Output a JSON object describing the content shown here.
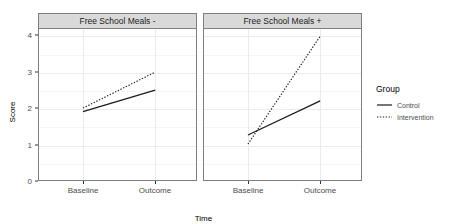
{
  "chart_data": {
    "type": "line",
    "title": "",
    "xlabel": "Time",
    "ylabel": "Score",
    "categories": [
      "Baseline",
      "Outcome"
    ],
    "ylim": [
      0,
      4.2
    ],
    "yticks": [
      0,
      1,
      2,
      3,
      4
    ],
    "ytick_labels": [
      "0",
      "1",
      "2",
      "3",
      "4"
    ],
    "grid": true,
    "legend_position": "right",
    "legend_title": "Group",
    "facets": [
      {
        "label": "Free School Meals -",
        "series": [
          {
            "name": "Control",
            "linestyle": "solid",
            "color": "#1a1a1a",
            "values": [
              1.9,
              2.5
            ]
          },
          {
            "name": "Intervention",
            "linestyle": "dotted",
            "color": "#1a1a1a",
            "values": [
              2.0,
              3.0
            ]
          }
        ]
      },
      {
        "label": "Free School Meals +",
        "series": [
          {
            "name": "Control",
            "linestyle": "solid",
            "color": "#1a1a1a",
            "values": [
              1.25,
              2.2
            ]
          },
          {
            "name": "Intervention",
            "linestyle": "dotted",
            "color": "#1a1a1a",
            "values": [
              1.0,
              4.0
            ]
          }
        ]
      }
    ],
    "legend_entries": [
      {
        "label": "Control",
        "linestyle": "solid",
        "color": "#1a1a1a"
      },
      {
        "label": "Intervention",
        "linestyle": "dotted",
        "color": "#1a1a1a"
      }
    ]
  },
  "theme": {
    "panel_background": "#ffffff",
    "panel_border": "#7f7f7f",
    "strip_background": "#d9d9d9",
    "grid_major": "#ebebeb",
    "grid_minor": "#f5f5f5",
    "text": "#4d4d4d"
  }
}
